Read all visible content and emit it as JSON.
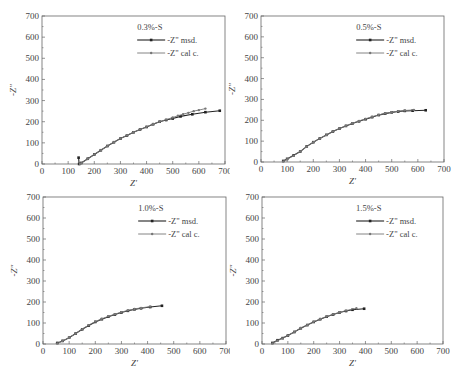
{
  "chart_data": [
    {
      "type": "line",
      "panel": "top-left",
      "title": "0.3%-S",
      "xlabel": "Z'",
      "ylabel": "-Z\"",
      "xlim": [
        0,
        700
      ],
      "ylim": [
        0,
        700
      ],
      "xticks": [
        0,
        100,
        200,
        300,
        400,
        500,
        600,
        700
      ],
      "yticks": [
        0,
        100,
        200,
        300,
        400,
        500,
        600,
        700
      ],
      "legend": [
        "-Z\" msd.",
        "-Z\" cal c."
      ],
      "legend_position": "upper right",
      "grid": false,
      "series": [
        {
          "name": "-Z\" msd.",
          "marker": "square",
          "x": [
            140,
            142,
            150,
            175,
            200,
            225,
            250,
            275,
            300,
            325,
            350,
            375,
            400,
            425,
            450,
            475,
            500,
            530,
            575,
            625,
            680
          ],
          "y": [
            30,
            0,
            5,
            25,
            45,
            65,
            85,
            103,
            120,
            135,
            150,
            163,
            175,
            188,
            200,
            208,
            215,
            225,
            235,
            245,
            252
          ]
        },
        {
          "name": "-Z\" cal c.",
          "marker": "diamond",
          "x": [
            145,
            150,
            175,
            200,
            225,
            250,
            275,
            300,
            325,
            350,
            375,
            400,
            425,
            450,
            475,
            500,
            520,
            540,
            560,
            580,
            600,
            625
          ],
          "y": [
            0,
            4,
            24,
            45,
            65,
            85,
            103,
            120,
            136,
            150,
            163,
            176,
            189,
            200,
            210,
            220,
            228,
            236,
            242,
            250,
            255,
            262
          ]
        }
      ]
    },
    {
      "type": "line",
      "panel": "top-right",
      "title": "0.5%-S",
      "xlabel": "Z'",
      "ylabel": "-Z\"",
      "xlim": [
        0,
        700
      ],
      "ylim": [
        0,
        700
      ],
      "xticks": [
        0,
        100,
        200,
        300,
        400,
        500,
        600,
        700
      ],
      "yticks": [
        0,
        100,
        200,
        300,
        400,
        500,
        600,
        700
      ],
      "legend": [
        "-Z\" msd.",
        "-Z\" cal c."
      ],
      "legend_position": "upper right",
      "grid": false,
      "series": [
        {
          "name": "-Z\" msd.",
          "marker": "square",
          "x": [
            85,
            100,
            125,
            150,
            175,
            200,
            225,
            250,
            275,
            300,
            325,
            350,
            375,
            400,
            425,
            450,
            475,
            500,
            525,
            550,
            580,
            630
          ],
          "y": [
            5,
            15,
            32,
            50,
            75,
            95,
            113,
            130,
            146,
            160,
            173,
            185,
            195,
            205,
            215,
            225,
            232,
            238,
            242,
            245,
            246,
            248
          ]
        },
        {
          "name": "-Z\" cal c.",
          "marker": "diamond",
          "x": [
            85,
            100,
            125,
            150,
            175,
            200,
            225,
            250,
            275,
            300,
            325,
            350,
            375,
            400,
            425,
            450,
            475,
            500,
            525,
            550,
            585
          ],
          "y": [
            3,
            13,
            30,
            50,
            74,
            95,
            113,
            130,
            146,
            160,
            174,
            186,
            197,
            207,
            217,
            226,
            233,
            239,
            244,
            247,
            250
          ]
        }
      ]
    },
    {
      "type": "line",
      "panel": "bottom-left",
      "title": "1.0%-S",
      "xlabel": "Z'",
      "ylabel": "-Z\"",
      "xlim": [
        0,
        700
      ],
      "ylim": [
        0,
        700
      ],
      "xticks": [
        0,
        100,
        200,
        300,
        400,
        500,
        600,
        700
      ],
      "yticks": [
        0,
        100,
        200,
        300,
        400,
        500,
        600,
        700
      ],
      "legend": [
        "-Z\" msd.",
        "-Z\" cal c."
      ],
      "legend_position": "upper right",
      "grid": false,
      "series": [
        {
          "name": "-Z\" msd.",
          "marker": "square",
          "x": [
            55,
            75,
            100,
            125,
            150,
            175,
            200,
            225,
            250,
            275,
            300,
            325,
            350,
            375,
            410,
            455
          ],
          "y": [
            5,
            15,
            30,
            50,
            70,
            88,
            105,
            118,
            130,
            140,
            150,
            158,
            165,
            170,
            176,
            182
          ]
        },
        {
          "name": "-Z\" cal c.",
          "marker": "diamond",
          "x": [
            55,
            75,
            100,
            125,
            150,
            175,
            200,
            225,
            250,
            275,
            300,
            325,
            350,
            375,
            410
          ],
          "y": [
            3,
            14,
            30,
            50,
            71,
            90,
            107,
            120,
            132,
            142,
            152,
            160,
            167,
            172,
            178
          ]
        }
      ]
    },
    {
      "type": "line",
      "panel": "bottom-right",
      "title": "1.5%-S",
      "xlabel": "Z'",
      "ylabel": "-Z\"",
      "xlim": [
        0,
        700
      ],
      "ylim": [
        0,
        700
      ],
      "xticks": [
        0,
        100,
        200,
        300,
        400,
        500,
        600,
        700
      ],
      "yticks": [
        0,
        100,
        200,
        300,
        400,
        500,
        600,
        700
      ],
      "legend": [
        "-Z\" msd.",
        "-Z\" cal c."
      ],
      "legend_position": "upper right",
      "grid": false,
      "series": [
        {
          "name": "-Z\" msd.",
          "marker": "square",
          "x": [
            40,
            60,
            80,
            100,
            125,
            150,
            175,
            200,
            225,
            250,
            275,
            300,
            325,
            350,
            395
          ],
          "y": [
            5,
            18,
            28,
            40,
            57,
            75,
            90,
            105,
            118,
            130,
            140,
            150,
            157,
            163,
            168
          ]
        },
        {
          "name": "-Z\" cal c.",
          "marker": "diamond",
          "x": [
            40,
            60,
            80,
            100,
            125,
            150,
            175,
            200,
            225,
            250,
            275,
            300,
            325,
            365
          ],
          "y": [
            3,
            16,
            27,
            40,
            58,
            76,
            91,
            106,
            119,
            131,
            141,
            151,
            159,
            170
          ]
        }
      ]
    }
  ]
}
